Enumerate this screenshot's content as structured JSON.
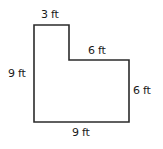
{
  "diagram": {
    "type": "L-shaped floor plan",
    "stroke_color": "#2b2b2b",
    "labels": {
      "top": "3 ft",
      "inner_horizontal": "6 ft",
      "left": "9 ft",
      "right": "6 ft",
      "bottom": "9 ft"
    },
    "dimensions_ft": {
      "top_width": 3,
      "inner_step_width": 6,
      "left_height": 9,
      "right_height": 6,
      "bottom_width": 9
    }
  }
}
